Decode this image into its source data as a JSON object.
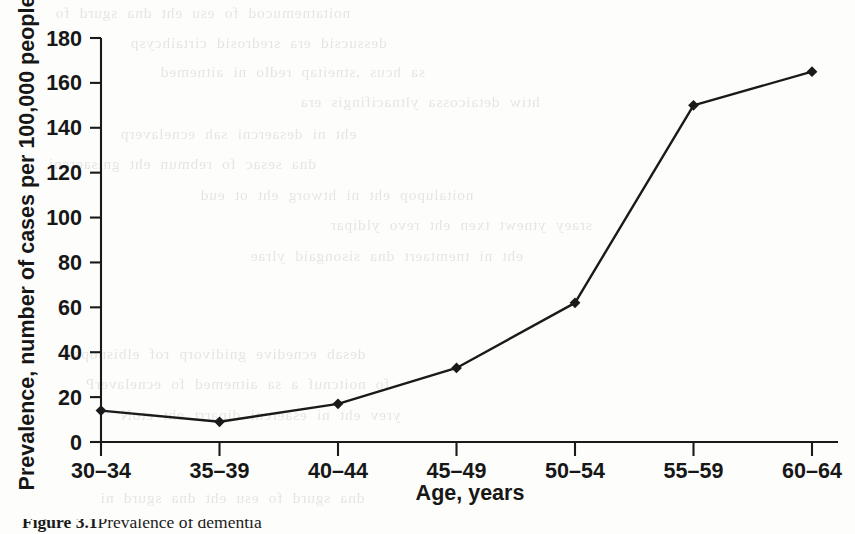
{
  "chart_data": {
    "type": "line",
    "title": "",
    "xlabel": "Age, years",
    "ylabel": "Prevalence, number of cases per 100,000 people",
    "categories": [
      "30–34",
      "35–39",
      "40–44",
      "45–49",
      "50–54",
      "55–59",
      "60–64"
    ],
    "values": [
      14,
      9,
      17,
      33,
      62,
      150,
      165
    ],
    "ylim": [
      0,
      180
    ],
    "y_ticks": [
      0,
      20,
      40,
      60,
      80,
      100,
      120,
      140,
      160,
      180
    ],
    "y_tick_labels": [
      "0",
      "20",
      "40",
      "60",
      "80",
      "100",
      "120",
      "140",
      "160",
      "180"
    ],
    "grid": false,
    "legend": false,
    "legend_position": "none",
    "marker": "diamond",
    "series_color": "#1a1a1a",
    "line_color": "#1a1a1a"
  },
  "caption": {
    "label": "Figure 3.1",
    "text": "Prevalence of dementia"
  },
  "ghost_text": {
    "lines": [
      "noitatnemucod  fo  esu  eht  dna  sgurd  fo",
      "dessucsid  era  sredrosid  cirtaihcysp",
      "sa  hcus  ,stneitap  redlo  ni  aitnemed",
      "htiw  detaicossa  yltnacifingis  era",
      "eht  ni  desaercni  sah  ecnelaverp",
      "dna  sesac  fo  rebmun  eht  gnisaercni",
      "noitalupop  eht  ni  htworg  eht  ot  eud",
      "sraey  ytnewt  txen  eht  revo  yldipar",
      "eht  ni  tnemtaert  dna  sisongaid  ylrae",
      "desab  ecnedive  gnidivorp  rof  elbisnopser",
      "fo  noitcnuf  a  sa  aitnemed  fo  ecnelaverP",
      "yrev  eht  ni  esaercni  diparrt  eht  etoN",
      "dna  sgurd  fo  esu  eht  dna  sgurd  ni"
    ]
  }
}
